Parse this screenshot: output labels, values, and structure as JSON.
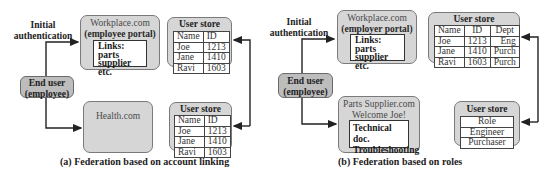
{
  "panel_a": {
    "initial_auth": [
      "Initial",
      "authentication"
    ],
    "workplace": {
      "title": "Workplace.com",
      "subtitle": "(employee portal)",
      "links": [
        "Links:",
        "parts supplier",
        "etc."
      ]
    },
    "user_store_top": {
      "title": "User store",
      "headers": [
        "Name",
        "ID"
      ],
      "rows": [
        [
          "Joe",
          "1213"
        ],
        [
          "Jane",
          "1410"
        ],
        [
          "Ravi",
          "1603"
        ]
      ]
    },
    "end_user": [
      "End user",
      "(employee)"
    ],
    "health": {
      "title": "Health.com"
    },
    "user_store_bottom": {
      "title": "User store",
      "headers": [
        "Name",
        "ID"
      ],
      "rows": [
        [
          "Joe",
          "1213"
        ],
        [
          "Jane",
          "1410"
        ],
        [
          "Ravi",
          "1603"
        ]
      ]
    },
    "caption": "(a) Federation based on account linking"
  },
  "panel_b": {
    "initial_auth": [
      "Initial",
      "authentication"
    ],
    "workplace": {
      "title": "Workplace.com",
      "subtitle": "(employer portal)",
      "links": [
        "Links:",
        "parts supplier",
        "etc."
      ]
    },
    "user_store_top": {
      "title": "User store",
      "headers": [
        "Name",
        "ID",
        "Dept"
      ],
      "rows": [
        [
          "Joe",
          "1213",
          "Eng"
        ],
        [
          "Jane",
          "1410",
          "Purch"
        ],
        [
          "Ravi",
          "1603",
          "Purch"
        ]
      ]
    },
    "end_user": [
      "End user",
      "(employee)"
    ],
    "parts": {
      "title": "Parts Supplier.com",
      "subtitle": "Welcome Joe!",
      "links": [
        "Technical doc.",
        "Troubleshooting"
      ]
    },
    "user_store_roles": {
      "title": "User store",
      "rows": [
        "Role",
        "Engineer",
        "Purchaser"
      ]
    },
    "caption": "(b) Federation based on roles"
  }
}
